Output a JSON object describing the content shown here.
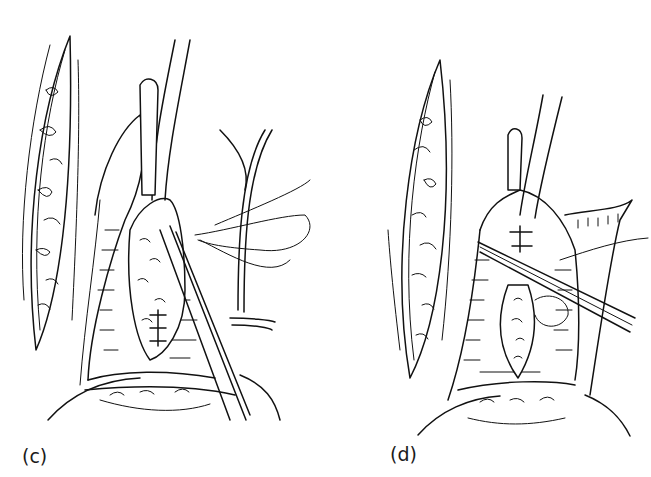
{
  "figure": {
    "panels": [
      {
        "label": "(c)",
        "description": "surgical field with retracted tissue flap, catheter tube, forceps and suture"
      },
      {
        "label": "(d)",
        "description": "surgical field with retracted tissue flap, catheter tube, forceps and closed incision"
      }
    ],
    "colors": {
      "ink": "#111111",
      "background": "#ffffff"
    }
  }
}
